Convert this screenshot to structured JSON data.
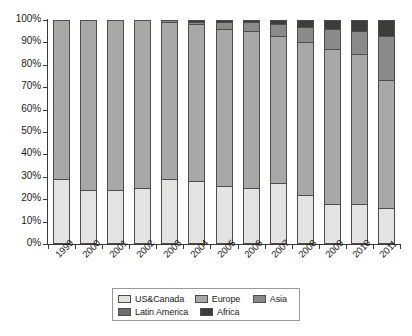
{
  "chart_data": {
    "type": "bar",
    "subtype": "stacked-percentage",
    "title": "",
    "xlabel": "",
    "ylabel": "",
    "ylim": [
      0,
      100
    ],
    "ytick_labels": [
      "0%",
      "10%",
      "20%",
      "30%",
      "40%",
      "50%",
      "60%",
      "70%",
      "80%",
      "90%",
      "100%"
    ],
    "ytick_values": [
      0,
      10,
      20,
      30,
      40,
      50,
      60,
      70,
      80,
      90,
      100
    ],
    "grid": false,
    "legend_position": "bottom",
    "categories": [
      "1999",
      "2000",
      "2001",
      "2002",
      "2003",
      "2004",
      "2005",
      "2006",
      "2007",
      "2008",
      "2009",
      "2010",
      "2011"
    ],
    "series": [
      {
        "name": "US&Canada",
        "color": "#e3e3e1",
        "values": [
          29,
          24,
          24,
          25,
          29,
          28,
          26,
          25,
          27,
          22,
          18,
          18,
          16
        ]
      },
      {
        "name": "Europe",
        "color": "#a8a8a6",
        "values": [
          71,
          76,
          76,
          75,
          70,
          70,
          70,
          70,
          66,
          68,
          69,
          67,
          57
        ]
      },
      {
        "name": "Asia",
        "color": "#8a8a88",
        "values": [
          0,
          0,
          0,
          0,
          1,
          1,
          3,
          4,
          5,
          7,
          9,
          10,
          20
        ]
      },
      {
        "name": "Latin America",
        "color": "#6e6e6c",
        "values": [
          0,
          0,
          0,
          0,
          0,
          0,
          0,
          0,
          0,
          0,
          0,
          0,
          0
        ]
      },
      {
        "name": "Africa",
        "color": "#3c3c3a",
        "values": [
          0,
          0,
          0,
          0,
          0,
          1,
          1,
          1,
          2,
          3,
          4,
          5,
          7
        ]
      }
    ]
  },
  "legend": {
    "row1": [
      {
        "label": "US&Canada",
        "color": "#e3e3e1"
      },
      {
        "label": "Europe",
        "color": "#a8a8a6"
      },
      {
        "label": "Asia",
        "color": "#8a8a88"
      }
    ],
    "row2": [
      {
        "label": "Latin America",
        "color": "#6e6e6c"
      },
      {
        "label": "Africa",
        "color": "#3c3c3a"
      }
    ]
  }
}
